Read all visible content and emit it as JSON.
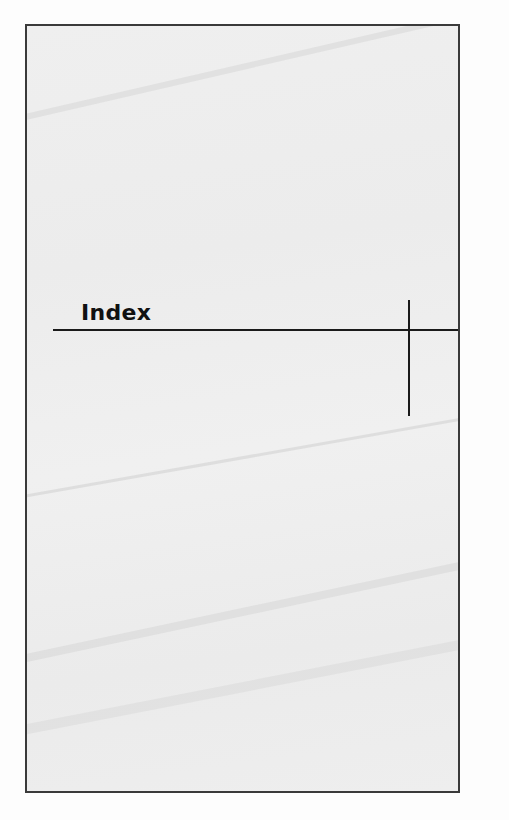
{
  "page": {
    "heading": "Index",
    "colors": {
      "background": "#fdfdfd",
      "panel": "#eeeeee",
      "border": "#3a3a3a",
      "text": "#111111",
      "rules": "#1a1a1a"
    }
  }
}
